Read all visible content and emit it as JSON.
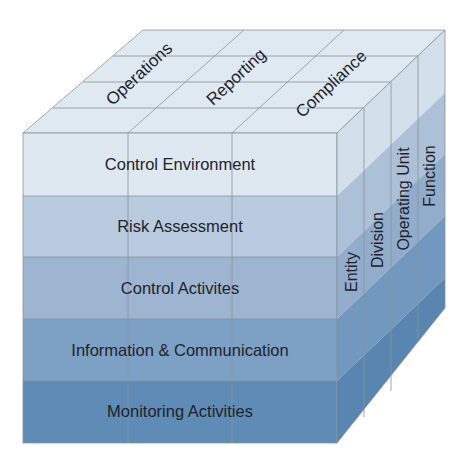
{
  "diagram": {
    "top_face": {
      "labels": [
        "Operations",
        "Reporting",
        "Compliance"
      ],
      "color": "#dfe9f1"
    },
    "front_face": {
      "rows": [
        {
          "label": "Control Environment",
          "color": "#dde8f1"
        },
        {
          "label": "Risk Assessment",
          "color": "#b8cbdf"
        },
        {
          "label": "Control Activites",
          "color": "#9db5d1"
        },
        {
          "label": "Information & Communication",
          "color": "#7da0c5"
        },
        {
          "label": "Monitoring Activities",
          "color": "#5e8cb6"
        }
      ]
    },
    "side_face": {
      "labels": [
        "Entity",
        "Division",
        "Operating Unit",
        "Function"
      ],
      "row_colors": [
        "#d3e0ec",
        "#acc1d8",
        "#92adcb",
        "#7398bf",
        "#5886b1"
      ]
    }
  }
}
